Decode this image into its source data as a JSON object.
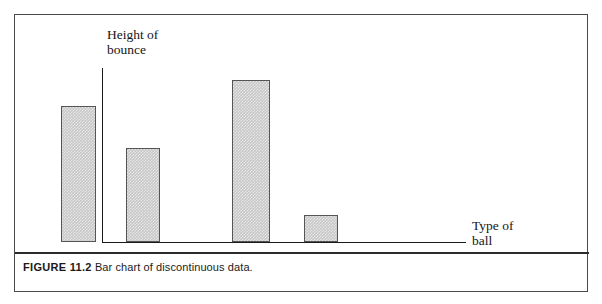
{
  "figure": {
    "caption_number": "FIGURE 11.2",
    "caption_text": "Bar chart of discontinuous data."
  },
  "chart_data": {
    "type": "bar",
    "title": "",
    "subtitle": "",
    "xlabel": "Type of\nball",
    "ylabel": "Height of\nbounce",
    "categories": [
      "",
      "",
      "",
      ""
    ],
    "values": [
      136,
      94,
      162,
      27
    ],
    "ylim": [
      0,
      175
    ],
    "grid": false,
    "legend": false,
    "axis_ticks": false,
    "tick_labels": [],
    "annotations": [],
    "bar_fill_color": "#c6c6c6",
    "bar_border_color": "#555555",
    "axis_color": "#1a1a1a",
    "bars": [
      {
        "name": "bar-1",
        "left": 46,
        "width": 35,
        "height": 136
      },
      {
        "name": "bar-2",
        "left": 111,
        "width": 34,
        "height": 94
      },
      {
        "name": "bar-3",
        "left": 217,
        "width": 38,
        "height": 162
      },
      {
        "name": "bar-4",
        "left": 289,
        "width": 34,
        "height": 27
      }
    ]
  }
}
